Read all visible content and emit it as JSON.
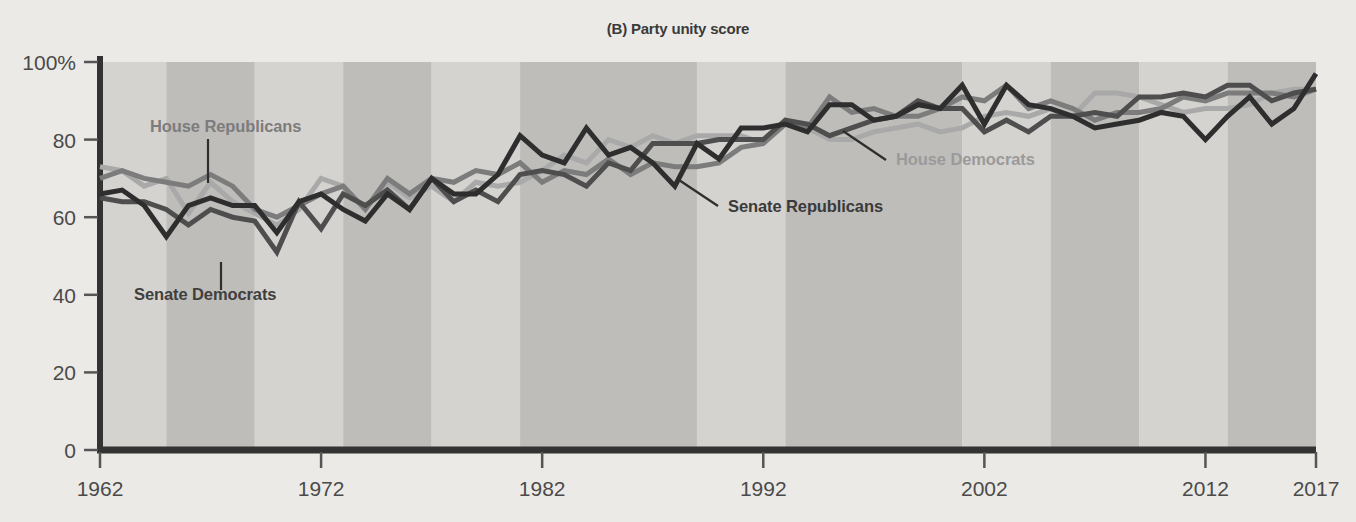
{
  "chart_data": {
    "type": "line",
    "title": "(B) Party unity score",
    "xlabel": "",
    "ylabel": "",
    "xlim": [
      1962,
      2017
    ],
    "ylim": [
      0,
      100
    ],
    "grid": false,
    "legend_position": "inline-annotations",
    "xticks": [
      "1962",
      "1972",
      "1982",
      "1992",
      "2002",
      "2012",
      "2017"
    ],
    "xtick_values": [
      1962,
      1972,
      1982,
      1992,
      2002,
      2012,
      2017
    ],
    "yticks": [
      "0",
      "20",
      "40",
      "60",
      "80",
      "100%"
    ],
    "ytick_values": [
      0,
      20,
      40,
      60,
      80,
      100
    ],
    "x": [
      1962,
      1963,
      1964,
      1965,
      1966,
      1967,
      1968,
      1969,
      1970,
      1971,
      1972,
      1973,
      1974,
      1975,
      1976,
      1977,
      1978,
      1979,
      1980,
      1981,
      1982,
      1983,
      1984,
      1985,
      1986,
      1987,
      1988,
      1989,
      1990,
      1991,
      1992,
      1993,
      1994,
      1995,
      1996,
      1997,
      1998,
      1999,
      2000,
      2001,
      2002,
      2003,
      2004,
      2005,
      2006,
      2007,
      2008,
      2009,
      2010,
      2011,
      2012,
      2013,
      2014,
      2015,
      2016,
      2017
    ],
    "series": [
      {
        "name": "House Republicans",
        "color": "#7c7c7c",
        "values": [
          70,
          72,
          70,
          69,
          68,
          71,
          68,
          62,
          60,
          63,
          66,
          68,
          62,
          70,
          66,
          70,
          69,
          72,
          71,
          74,
          69,
          72,
          71,
          75,
          71,
          74,
          73,
          73,
          74,
          78,
          79,
          84,
          83,
          91,
          87,
          88,
          86,
          86,
          88,
          91,
          90,
          94,
          88,
          90,
          88,
          85,
          87,
          87,
          88,
          91,
          90,
          92,
          92,
          92,
          91,
          93
        ]
      },
      {
        "name": "House Democrats",
        "color": "#a9a9a9",
        "values": [
          73,
          72,
          68,
          70,
          61,
          69,
          64,
          61,
          58,
          62,
          70,
          68,
          62,
          69,
          65,
          68,
          64,
          69,
          68,
          69,
          72,
          76,
          74,
          80,
          78,
          81,
          79,
          81,
          81,
          81,
          79,
          85,
          83,
          80,
          80,
          82,
          83,
          84,
          82,
          83,
          86,
          87,
          86,
          88,
          86,
          92,
          92,
          91,
          89,
          87,
          88,
          88,
          89,
          92,
          93,
          93
        ]
      },
      {
        "name": "Senate Republicans",
        "color": "#2e2e2e",
        "values": [
          66,
          67,
          63,
          55,
          63,
          65,
          63,
          63,
          56,
          64,
          66,
          62,
          59,
          66,
          62,
          70,
          66,
          66,
          71,
          81,
          76,
          74,
          83,
          76,
          78,
          74,
          68,
          79,
          75,
          83,
          83,
          84,
          82,
          89,
          89,
          85,
          86,
          89,
          88,
          94,
          84,
          94,
          89,
          88,
          86,
          83,
          84,
          85,
          87,
          86,
          80,
          86,
          91,
          84,
          88,
          97
        ]
      },
      {
        "name": "Senate Democrats",
        "color": "#4e4e4e",
        "values": [
          65,
          64,
          64,
          62,
          58,
          62,
          60,
          59,
          51,
          64,
          57,
          66,
          63,
          67,
          62,
          70,
          64,
          67,
          64,
          71,
          72,
          71,
          68,
          74,
          72,
          79,
          79,
          79,
          80,
          80,
          80,
          85,
          84,
          81,
          83,
          85,
          86,
          90,
          88,
          88,
          82,
          85,
          82,
          86,
          86,
          87,
          86,
          91,
          91,
          92,
          91,
          94,
          94,
          90,
          92,
          93
        ]
      }
    ],
    "annotations": [
      {
        "name": "House Republicans",
        "color": "#7c7c7c",
        "text_x": 150,
        "text_y": 132,
        "anchor": "start",
        "leader": {
          "x1": 208,
          "y1": 139,
          "x2": 208,
          "y2": 183
        }
      },
      {
        "name": "Senate Democrats",
        "color": "#3f3f3f",
        "text_x": 134,
        "text_y": 300,
        "anchor": "start",
        "leader": {
          "x1": 221,
          "y1": 262,
          "x2": 221,
          "y2": 290
        }
      },
      {
        "name": "House Democrats",
        "color": "#9a9a9a",
        "text_x": 896,
        "text_y": 165,
        "anchor": "start",
        "leader": {
          "x1": 886,
          "y1": 160,
          "x2": 843,
          "y2": 131
        }
      },
      {
        "name": "Senate Republicans",
        "color": "#3a3a3a",
        "text_x": 728,
        "text_y": 212,
        "anchor": "start",
        "leader": {
          "x1": 718,
          "y1": 206,
          "x2": 679,
          "y2": 180
        }
      }
    ],
    "background_bands": {
      "light_color": "#d5d3d0",
      "dark_color": "#bfbdba",
      "boundaries": [
        1962,
        1965,
        1969,
        1973,
        1977,
        1981,
        1989,
        1993,
        2001,
        2005,
        2009,
        2013,
        2017
      ]
    },
    "axis_color": "#333333",
    "plot_background": "#d5d3d0"
  }
}
